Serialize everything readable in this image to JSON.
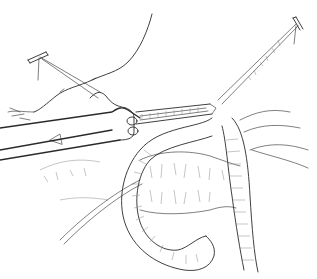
{
  "image": {
    "kind": "surgical line illustration",
    "width": 317,
    "height": 279,
    "background": "#ffffff",
    "ink": "#2a2a2a",
    "elements": [
      "stay-suture-left",
      "stay-suture-right",
      "stapler-instrument",
      "stomach-outline",
      "bowel-loop",
      "omentum-tissue",
      "mesentery-lines"
    ]
  }
}
